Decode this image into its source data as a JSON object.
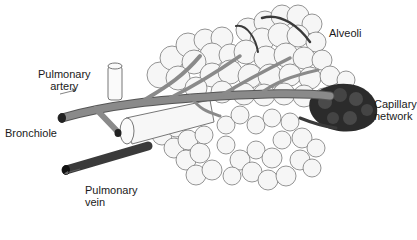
{
  "figure": {
    "labels": {
      "pulmonary_artery": [
        "Pulmonary",
        "artery"
      ],
      "bronchiole": "Bronchiole",
      "pulmonary_vein": [
        "Pulmonary",
        "vein"
      ],
      "alveoli": "Alveoli",
      "capillary_network": [
        "Capillary",
        "network"
      ]
    },
    "colors": {
      "artery": "#8a8a8a",
      "vein": "#3a3a3a",
      "capillary": "#2b2b2b",
      "alveolus_fill": "#f6f6f6",
      "label_text": "#1a1a1a"
    }
  }
}
